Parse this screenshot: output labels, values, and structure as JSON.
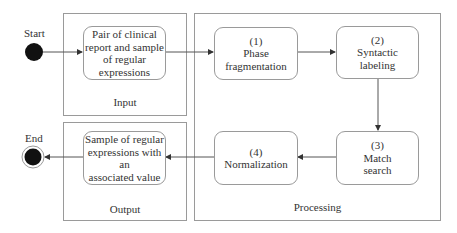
{
  "diagram": {
    "start_label": "Start",
    "end_label": "End",
    "groups": {
      "input": "Input",
      "processing": "Processing",
      "output": "Output"
    },
    "nodes": {
      "input_node": [
        "Pair of clinical",
        "report and sample",
        "of regular",
        "expressions"
      ],
      "step1": [
        "(1)",
        "Phase",
        "fragmentation"
      ],
      "step2": [
        "(2)",
        "Syntactic",
        "labeling"
      ],
      "step3": [
        "(3)",
        "Match",
        "search"
      ],
      "step4": [
        "(4)",
        "Normalization"
      ],
      "output_node": [
        "Sample of regular",
        "expressions with an",
        "associated value"
      ]
    },
    "edges": [
      {
        "from": "start",
        "to": "input_node"
      },
      {
        "from": "input_node",
        "to": "step1"
      },
      {
        "from": "step1",
        "to": "step2"
      },
      {
        "from": "step2",
        "to": "step3"
      },
      {
        "from": "step3",
        "to": "step4"
      },
      {
        "from": "step4",
        "to": "output_node"
      },
      {
        "from": "output_node",
        "to": "end"
      }
    ]
  }
}
